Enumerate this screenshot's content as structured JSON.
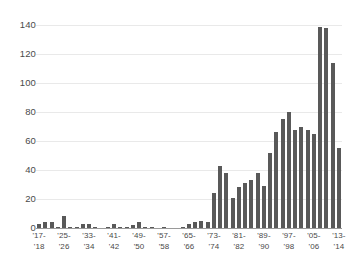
{
  "chart_data": {
    "type": "bar",
    "title": "",
    "subtitle": "",
    "xlabel": "",
    "ylabel": "",
    "ylim": [
      0,
      145
    ],
    "yticks": [
      0,
      20,
      40,
      60,
      80,
      100,
      120,
      140
    ],
    "ytick_labels": [
      "0",
      "20",
      "40",
      "60",
      "80",
      "100",
      "120",
      "140"
    ],
    "grid": true,
    "legend": null,
    "bar_color": "#595959",
    "grid_color": "#e9e9e9",
    "axis_color": "#9a9a9a",
    "xtick_labels": [
      {
        "line1": "'17-",
        "line2": "'18",
        "index": 0
      },
      {
        "line1": "'25-",
        "line2": "'26",
        "index": 4
      },
      {
        "line1": "'33-",
        "line2": "'34",
        "index": 8
      },
      {
        "line1": "'41-",
        "line2": "'42",
        "index": 12
      },
      {
        "line1": "'49-",
        "line2": "'50",
        "index": 16
      },
      {
        "line1": "'57-",
        "line2": "'58",
        "index": 20
      },
      {
        "line1": "'65-",
        "line2": "'66",
        "index": 24
      },
      {
        "line1": "'73-",
        "line2": "'74",
        "index": 28
      },
      {
        "line1": "'81-",
        "line2": "'82",
        "index": 32
      },
      {
        "line1": "'89-",
        "line2": "'90",
        "index": 36
      },
      {
        "line1": "'97-",
        "line2": "'98",
        "index": 40
      },
      {
        "line1": "'05-",
        "line2": "'06",
        "index": 44
      },
      {
        "line1": "'13-",
        "line2": "'14",
        "index": 48
      }
    ],
    "categories": [
      "'17-'18",
      "'19-'20",
      "'21-'22",
      "'23-'24",
      "'25-'26",
      "'27-'28",
      "'29-'30",
      "'31-'32",
      "'33-'34",
      "'35-'36",
      "'37-'38",
      "'39-'40",
      "'41-'42",
      "'43-'44",
      "'45-'46",
      "'47-'48",
      "'49-'50",
      "'51-'52",
      "'53-'54",
      "'55-'56",
      "'57-'58",
      "'59-'60",
      "'61-'62",
      "'63-'64",
      "'65-'66",
      "'67-'68",
      "'69-'70",
      "'71-'72",
      "'73-'74",
      "'75-'76",
      "'77-'78",
      "'79-'80",
      "'81-'82",
      "'83-'84",
      "'85-'86",
      "'87-'88",
      "'89-'90",
      "'91-'92",
      "'93-'94",
      "'95-'96",
      "'97-'98",
      "'99-'00",
      "'01-'02",
      "'03-'04",
      "'05-'06",
      "'07-'08",
      "'09-'10",
      "'11-'12",
      "'13-'14"
    ],
    "values": [
      3,
      4,
      4,
      1,
      8,
      1,
      1,
      3,
      3,
      1,
      0,
      1,
      3,
      1,
      1,
      2,
      4,
      1,
      1,
      0,
      1,
      0,
      0,
      1,
      3,
      4,
      5,
      4,
      24,
      43,
      38,
      21,
      28,
      31,
      33,
      38,
      29,
      52,
      66,
      75,
      80,
      68,
      70,
      68,
      65,
      139,
      138,
      114,
      55
    ]
  }
}
